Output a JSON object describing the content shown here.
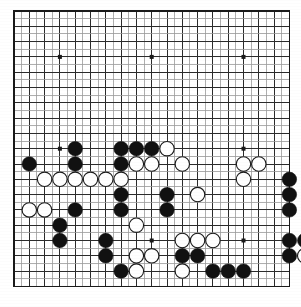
{
  "app": {
    "title": "Go Board Diagram",
    "board_size": 19
  },
  "board": {
    "name": "go-board",
    "size": 19,
    "origin_x": 14,
    "origin_y": 11,
    "spacing": 15.3,
    "line_color": "#2b2b2b",
    "thin_line_color": "#9a9a9a",
    "border_color": "#1a1a1a",
    "background_color": "#ffffff",
    "stone_radius": 7.2,
    "star_radius": 2.0,
    "star_color": "#1a1a1a",
    "black_color": "#111111",
    "white_color": "#ffffff",
    "white_edge_color": "#1a1a1a",
    "star_points": [
      {
        "col": 4,
        "row": 4
      },
      {
        "col": 10,
        "row": 4
      },
      {
        "col": 16,
        "row": 4
      },
      {
        "col": 4,
        "row": 10
      },
      {
        "col": 10,
        "row": 10
      },
      {
        "col": 16,
        "row": 10
      },
      {
        "col": 4,
        "row": 16
      },
      {
        "col": 10,
        "row": 16
      },
      {
        "col": 16,
        "row": 16
      }
    ],
    "black_stones": [
      {
        "col": 5,
        "row": 10
      },
      {
        "col": 8,
        "row": 10
      },
      {
        "col": 9,
        "row": 10
      },
      {
        "col": 10,
        "row": 10
      },
      {
        "col": 2,
        "row": 11
      },
      {
        "col": 5,
        "row": 11
      },
      {
        "col": 8,
        "row": 11
      },
      {
        "col": 19,
        "row": 12
      },
      {
        "col": 8,
        "row": 13
      },
      {
        "col": 11,
        "row": 13
      },
      {
        "col": 19,
        "row": 13
      },
      {
        "col": 5,
        "row": 14
      },
      {
        "col": 8,
        "row": 14
      },
      {
        "col": 11,
        "row": 14
      },
      {
        "col": 19,
        "row": 14
      },
      {
        "col": 22,
        "row": 14
      },
      {
        "col": 25,
        "row": 14
      },
      {
        "col": 4,
        "row": 15
      },
      {
        "col": 4,
        "row": 16
      },
      {
        "col": 7,
        "row": 16
      },
      {
        "col": 19,
        "row": 16
      },
      {
        "col": 20,
        "row": 16
      },
      {
        "col": 21,
        "row": 16
      },
      {
        "col": 7,
        "row": 17
      },
      {
        "col": 12,
        "row": 17
      },
      {
        "col": 13,
        "row": 17
      },
      {
        "col": 19,
        "row": 17
      },
      {
        "col": 8,
        "row": 18
      },
      {
        "col": 14,
        "row": 18
      },
      {
        "col": 15,
        "row": 18
      },
      {
        "col": 16,
        "row": 18
      }
    ],
    "white_stones": [
      {
        "col": 11,
        "row": 10
      },
      {
        "col": 9,
        "row": 11
      },
      {
        "col": 10,
        "row": 11
      },
      {
        "col": 12,
        "row": 11
      },
      {
        "col": 16,
        "row": 11
      },
      {
        "col": 17,
        "row": 11
      },
      {
        "col": 3,
        "row": 12
      },
      {
        "col": 4,
        "row": 12
      },
      {
        "col": 5,
        "row": 12
      },
      {
        "col": 6,
        "row": 12
      },
      {
        "col": 7,
        "row": 12
      },
      {
        "col": 8,
        "row": 12
      },
      {
        "col": 16,
        "row": 12
      },
      {
        "col": 13,
        "row": 13
      },
      {
        "col": 2,
        "row": 14
      },
      {
        "col": 3,
        "row": 14
      },
      {
        "col": 9,
        "row": 15
      },
      {
        "col": 12,
        "row": 16
      },
      {
        "col": 13,
        "row": 16
      },
      {
        "col": 14,
        "row": 16
      },
      {
        "col": 22,
        "row": 16
      },
      {
        "col": 23,
        "row": 16
      },
      {
        "col": 9,
        "row": 17
      },
      {
        "col": 10,
        "row": 17
      },
      {
        "col": 20,
        "row": 17
      },
      {
        "col": 21,
        "row": 17
      },
      {
        "col": 9,
        "row": 18
      },
      {
        "col": 12,
        "row": 18
      }
    ]
  },
  "stone_legend": {
    "black_label": "Black stone",
    "white_label": "White stone",
    "star_label": "Star point (hoshi)"
  }
}
